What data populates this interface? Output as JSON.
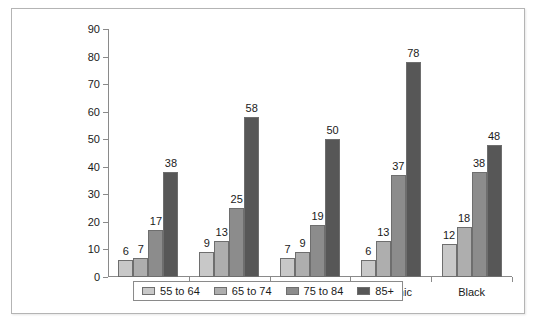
{
  "chart_data": {
    "type": "bar",
    "title": "",
    "subtitle": "",
    "xlabel": "",
    "ylabel": "",
    "ylim": [
      0,
      90
    ],
    "y_ticks": [
      0,
      10,
      20,
      30,
      40,
      50,
      60,
      70,
      80,
      90
    ],
    "grid": false,
    "legend_position": "bottom",
    "categories": [
      "Men",
      "Women",
      "White",
      "Hispanic",
      "Black"
    ],
    "series": [
      {
        "name": "55 to 64",
        "color": "#c8c8c8",
        "values": [
          6,
          9,
          7,
          6,
          12
        ]
      },
      {
        "name": "65 to 74",
        "color": "#aeaeae",
        "values": [
          7,
          13,
          9,
          13,
          18
        ]
      },
      {
        "name": "75 to 84",
        "color": "#8c8c8c",
        "values": [
          17,
          25,
          19,
          37,
          38
        ]
      },
      {
        "name": "85+",
        "color": "#575757",
        "values": [
          38,
          58,
          50,
          78,
          48
        ]
      }
    ]
  },
  "colors": {
    "axis": "#8a8a8a",
    "text": "#1a1a1a",
    "frame": "#b4b4b4",
    "background": "#ffffff"
  }
}
